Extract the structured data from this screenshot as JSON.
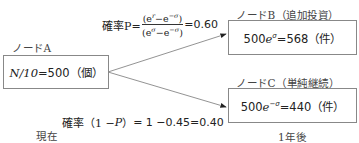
{
  "node_a": {
    "label": "ノードA",
    "expr_var": "N",
    "expr_rest": "/10",
    "expr_eq": "=500（個）"
  },
  "node_b": {
    "label": "ノードB（追加投資）",
    "expr_base": "500",
    "expr_e": "e",
    "expr_exp": "σ",
    "expr_eq": "=568（件）"
  },
  "node_c": {
    "label": "ノードC（単純継続）",
    "expr_base": "500",
    "expr_e": "e",
    "expr_exp": "−σ",
    "expr_eq": "=440（件）"
  },
  "prob_up": {
    "prefix": "確率P=",
    "num_open": "(e",
    "num_exp1": "r",
    "num_mid": "−e",
    "num_exp2": "−σ",
    "num_close": ")",
    "den_open": "(e",
    "den_exp1": "σ",
    "den_mid": "−e",
    "den_exp2": "−σ",
    "den_close": ")",
    "result": "=0.60"
  },
  "prob_down": {
    "prefix": "確率（1 −",
    "var": "P",
    "suffix": "）",
    "result": "= 1 −0.45=0.40"
  },
  "time_now": "現在",
  "time_next": "1年後",
  "colors": {
    "line": "#777777",
    "box_border": "#888888",
    "text": "#222222"
  }
}
